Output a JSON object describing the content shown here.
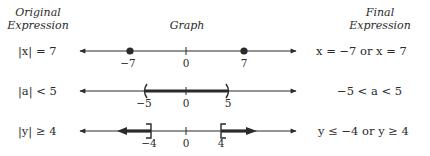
{
  "headers": {
    "original_line1": "Original",
    "original_line2": "Expression",
    "graph": "Graph",
    "final_line1": "Final",
    "final_line2": "Expression"
  },
  "rows": [
    {
      "original": "|x| = 7",
      "final": "x = −7   or   x = 7",
      "graph": {
        "type": "points",
        "points": [
          -7,
          7
        ],
        "tick_labels": [
          "−7",
          "0",
          "7"
        ]
      }
    },
    {
      "original": "|a| < 5",
      "final": "−5 < a < 5",
      "graph": {
        "type": "open-interval",
        "from": -5,
        "to": 5,
        "tick_labels": [
          "−5",
          "0",
          "5"
        ]
      }
    },
    {
      "original": "|y| ≥ 4",
      "final": "y ≤ −4   or   y ≥ 4",
      "graph": {
        "type": "closed-rays",
        "left_end": -4,
        "right_end": 4,
        "tick_labels": [
          "−4",
          "0",
          "4"
        ]
      }
    }
  ],
  "colors": {
    "line": "#2a2a2a",
    "highlight": "#333333"
  }
}
